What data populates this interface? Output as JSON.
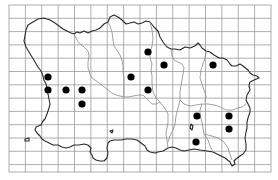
{
  "map": {
    "type": "distribution-grid-map",
    "region_shape": "island",
    "colors": {
      "background": "#ffffff",
      "grid": "#9a9a9a",
      "coastline": "#2a2a2a",
      "boundaries": "#8a8a8a",
      "dot": "#000000"
    },
    "grid": {
      "x0": 9,
      "y0": 5,
      "x1": 271,
      "y1": 172,
      "columns": 16,
      "rows": 12.5
    },
    "dots": [
      {
        "x": 148,
        "y": 52
      },
      {
        "x": 164,
        "y": 65
      },
      {
        "x": 213,
        "y": 65
      },
      {
        "x": 48,
        "y": 77
      },
      {
        "x": 131,
        "y": 77
      },
      {
        "x": 48,
        "y": 90
      },
      {
        "x": 66,
        "y": 90
      },
      {
        "x": 82,
        "y": 90
      },
      {
        "x": 148,
        "y": 90
      },
      {
        "x": 82,
        "y": 104
      },
      {
        "x": 197,
        "y": 116
      },
      {
        "x": 229,
        "y": 116
      },
      {
        "x": 229,
        "y": 129
      },
      {
        "x": 196,
        "y": 142
      }
    ],
    "dot_count": 14
  }
}
